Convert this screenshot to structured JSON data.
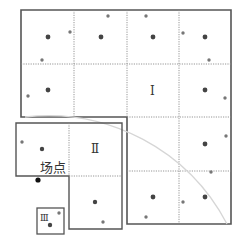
{
  "diagram": {
    "colors": {
      "border": "#555555",
      "grid": "#8a8a8a",
      "arc": "#d6d6d6",
      "sample_dot": "#444444",
      "edge_dot": "#777777",
      "site_dot": "#111111"
    },
    "zones": [
      {
        "id": "I",
        "label": "Ⅰ"
      },
      {
        "id": "II",
        "label": "Ⅱ"
      },
      {
        "id": "III",
        "label": "Ⅲ"
      }
    ],
    "site_label": "场点",
    "legend_note": ""
  }
}
